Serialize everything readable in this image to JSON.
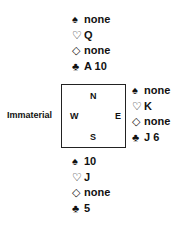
{
  "north": {
    "spades": "none",
    "hearts": "Q",
    "diamonds": "none",
    "clubs": "A 10"
  },
  "east": {
    "spades": "none",
    "hearts": "K",
    "diamonds": "none",
    "clubs": "J 6"
  },
  "south": {
    "spades": "10",
    "hearts": "J",
    "diamonds": "none",
    "clubs": "5"
  },
  "west": {
    "label": "Immaterial"
  },
  "compass": {
    "n": "N",
    "e": "E",
    "s": "S",
    "w": "W"
  },
  "icons": {
    "spade": "♠",
    "heart": "♡",
    "diamond": "◇",
    "club": "♣"
  }
}
